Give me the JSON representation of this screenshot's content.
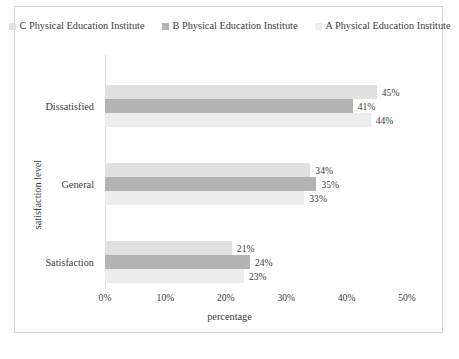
{
  "chart_data": {
    "type": "bar",
    "orientation": "horizontal",
    "title": "",
    "xlabel": "percentage",
    "ylabel": "satisfaction level",
    "categories": [
      "Dissatisfied",
      "General",
      "Satisfaction"
    ],
    "series": [
      {
        "name": "C Physical Education Institute",
        "color": "#e0e0e0",
        "values": [
          45,
          34,
          21
        ],
        "labels": [
          "45%",
          "34%",
          "21%"
        ]
      },
      {
        "name": "B Physical Education Institute",
        "color": "#b4b4b4",
        "values": [
          41,
          35,
          24
        ],
        "labels": [
          "41%",
          "35%",
          "24%"
        ]
      },
      {
        "name": "A Physical Education Institute",
        "color": "#ededed",
        "values": [
          44,
          33,
          23
        ],
        "labels": [
          "44%",
          "33%",
          "23%"
        ]
      }
    ],
    "xlim": [
      0,
      50
    ],
    "xticks": [
      0,
      10,
      20,
      30,
      40,
      50
    ],
    "xtick_labels": [
      "0%",
      "10%",
      "20%",
      "30%",
      "40%",
      "50%"
    ],
    "grid": false,
    "legend_position": "top"
  },
  "legend": {
    "entries": [
      {
        "label": "C Physical Education Institute"
      },
      {
        "label": "B Physical Education Institute"
      },
      {
        "label": "A Physical Education Institute"
      }
    ]
  },
  "axes": {
    "x_title": "percentage",
    "y_title": "satisfaction level",
    "x_ticks": [
      {
        "label": "0%"
      },
      {
        "label": "10%"
      },
      {
        "label": "20%"
      },
      {
        "label": "30%"
      },
      {
        "label": "40%"
      },
      {
        "label": "50%"
      }
    ],
    "y_categories": [
      {
        "label": "Dissatisfied"
      },
      {
        "label": "General"
      },
      {
        "label": "Satisfaction"
      }
    ]
  }
}
